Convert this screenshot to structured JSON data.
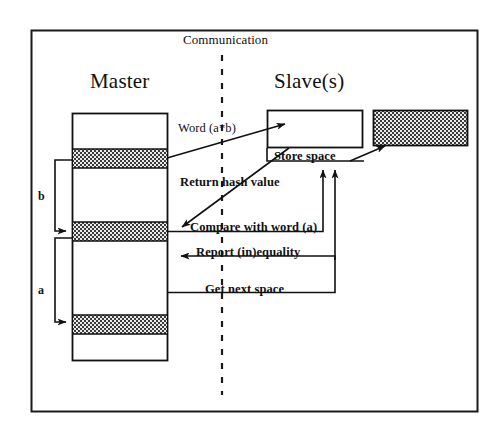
{
  "figure": {
    "type": "sequence-diagram",
    "title": "Communication",
    "outer_frame": true,
    "divider": "vertical-dashed-line"
  },
  "headers": {
    "left": "Master",
    "right": "Slave(s)"
  },
  "master": {
    "label": "Master",
    "description": "memory column with hatched word blocks",
    "brackets": [
      {
        "name": "b",
        "label": "b"
      },
      {
        "name": "a",
        "label": "a"
      }
    ],
    "blocks": [
      {
        "index": 0,
        "fill": "white"
      },
      {
        "index": 1,
        "fill": "hatched"
      },
      {
        "index": 2,
        "fill": "white"
      },
      {
        "index": 3,
        "fill": "hatched"
      },
      {
        "index": 4,
        "fill": "white"
      },
      {
        "index": 5,
        "fill": "hatched"
      },
      {
        "index": 6,
        "fill": "white"
      }
    ]
  },
  "slave": {
    "label": "Slave(s)",
    "store_space_label": "Store space",
    "empty_box_fill": "white",
    "filled_box_fill": "hatched"
  },
  "messages": [
    {
      "id": "word",
      "label": "Word (a*b)",
      "direction": "master-to-slave"
    },
    {
      "id": "return_hash",
      "label": "Return hash value",
      "direction": "slave-to-master"
    },
    {
      "id": "compare",
      "label": "Compare with word (a)",
      "direction": "slave-to-master"
    },
    {
      "id": "report",
      "label": "Report (in)equality",
      "direction": "slave-to-master"
    },
    {
      "id": "get_next",
      "label": "Get next space",
      "direction": "master-to-slave"
    }
  ],
  "colors": {
    "line": "#111111",
    "hatch_dark": "#3a3a3a",
    "hatch_light": "#e8e8e8",
    "background": "#ffffff"
  }
}
